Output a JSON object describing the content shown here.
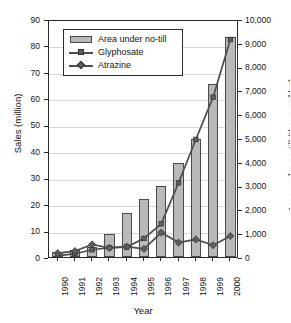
{
  "chart_data": {
    "type": "bar",
    "title": "",
    "subtitle": "",
    "xlabel": "Year",
    "ylabel": "Sales (million)",
    "y2label": "Area under no-till (thousand ha)",
    "categories": [
      "1990",
      "1991",
      "1992",
      "1993",
      "1994",
      "1995",
      "1996",
      "1997",
      "1998",
      "1999",
      "2000"
    ],
    "x": [
      1990,
      1991,
      1992,
      1993,
      1994,
      1995,
      1996,
      1997,
      1998,
      1999,
      2000
    ],
    "ylim": [
      0,
      90
    ],
    "y2lim": [
      0,
      10000
    ],
    "yticks": [
      0,
      10,
      20,
      30,
      40,
      50,
      60,
      70,
      80,
      90
    ],
    "ytick_labels": [
      "0",
      "10",
      "20",
      "30",
      "40",
      "50",
      "60",
      "70",
      "80",
      "90"
    ],
    "y2ticks": [
      0,
      1000,
      2000,
      3000,
      4000,
      5000,
      6000,
      7000,
      8000,
      9000,
      10000
    ],
    "y2tick_labels": [
      "0",
      "1,000",
      "2,000",
      "3,000",
      "4,000",
      "5,000",
      "6,000",
      "7,000",
      "8,000",
      "9,000",
      "10,000"
    ],
    "grid": true,
    "grid_axis": "y",
    "legend_position": "top-left",
    "series": [
      {
        "name": "Area under no-till",
        "type": "bar",
        "axis": "y2",
        "unit": "thousand ha",
        "values": [
          200,
          300,
          400,
          980,
          1830,
          2440,
          2970,
          3970,
          4960,
          7260,
          9250
        ]
      },
      {
        "name": "Glyphosate",
        "type": "line",
        "marker": "square",
        "axis": "y",
        "unit": "million",
        "values": [
          1.2,
          2.0,
          3.5,
          4.3,
          4.5,
          7.8,
          13.3,
          28.8,
          45.2,
          61.2,
          83.0
        ]
      },
      {
        "name": "Atrazine",
        "type": "line",
        "marker": "diamond",
        "axis": "y",
        "unit": "million",
        "values": [
          2.2,
          3.0,
          5.5,
          4.2,
          4.7,
          3.8,
          10.0,
          6.2,
          7.4,
          5.2,
          8.7
        ]
      }
    ]
  },
  "legend": {
    "items": [
      {
        "label": "Area under no-till",
        "marker": "bar"
      },
      {
        "label": "Glyphosate",
        "marker": "square"
      },
      {
        "label": "Atrazine",
        "marker": "diamond"
      }
    ]
  },
  "colors": {
    "bar_fill": "#b9b9b9",
    "bar_stroke": "#4a4a4a",
    "line": "#4d4d4d",
    "marker": "#5d5d5d",
    "axis": "#2b2b2b",
    "grid": "#d8d8d8",
    "background": "#ffffff",
    "text": "#141414"
  }
}
